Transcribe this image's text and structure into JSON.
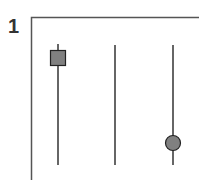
{
  "panel": {
    "label": "1"
  },
  "diagram": {
    "frame": {
      "left_x": 31,
      "top_y": 17,
      "color": "#555555"
    },
    "tracks": [
      {
        "x": 58,
        "y1": 44,
        "y2": 165,
        "marker": "square",
        "marker_y": 58
      },
      {
        "x": 115,
        "y1": 45,
        "y2": 165,
        "marker": "none"
      },
      {
        "x": 173,
        "y1": 45,
        "y2": 165,
        "marker": "circle",
        "marker_y": 143
      }
    ],
    "marker_fill": "#808080",
    "marker_stroke": "#222222",
    "line_color": "#333333"
  }
}
